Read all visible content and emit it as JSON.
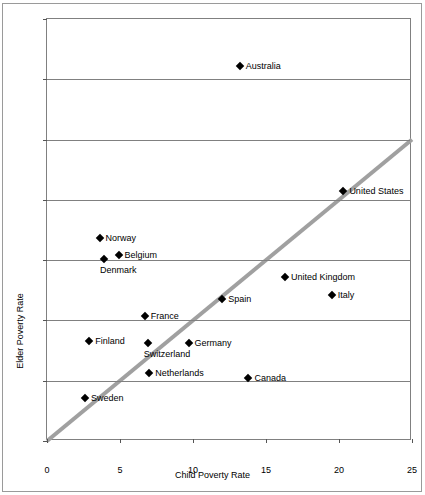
{
  "chart_data": {
    "type": "scatter",
    "title": "",
    "xlabel": "Child Poverty Rate",
    "ylabel": "Elder Poverty Rate",
    "xlim": [
      0,
      25
    ],
    "ylim": [
      0,
      35
    ],
    "xticks": [
      0,
      5,
      10,
      15,
      20,
      25
    ],
    "yticks": [
      0,
      5,
      10,
      15,
      20,
      25,
      30,
      35
    ],
    "grid": "horizontal",
    "legend": "none",
    "reference_line": {
      "name": "equality-line",
      "from": [
        0,
        0
      ],
      "to": [
        25,
        25
      ],
      "color": "#a0a0a0"
    },
    "marker_color": "#000000",
    "points": [
      {
        "label": "Australia",
        "x": 13.2,
        "y": 31.1,
        "label_pos": "right"
      },
      {
        "label": "United States",
        "x": 20.3,
        "y": 20.7,
        "label_pos": "right"
      },
      {
        "label": "Norway",
        "x": 3.6,
        "y": 16.8,
        "label_pos": "right"
      },
      {
        "label": "Belgium",
        "x": 4.9,
        "y": 15.4,
        "label_pos": "right"
      },
      {
        "label": "Denmark",
        "x": 3.9,
        "y": 15.1,
        "label_pos": "below"
      },
      {
        "label": "United Kingdom",
        "x": 16.3,
        "y": 13.6,
        "label_pos": "right"
      },
      {
        "label": "Italy",
        "x": 19.5,
        "y": 12.1,
        "label_pos": "right"
      },
      {
        "label": "Spain",
        "x": 12.0,
        "y": 11.8,
        "label_pos": "right"
      },
      {
        "label": "France",
        "x": 6.7,
        "y": 10.4,
        "label_pos": "right"
      },
      {
        "label": "Finland",
        "x": 2.9,
        "y": 8.3,
        "label_pos": "right"
      },
      {
        "label": "Germany",
        "x": 9.7,
        "y": 8.1,
        "label_pos": "right"
      },
      {
        "label": "Switzerland",
        "x": 6.9,
        "y": 8.1,
        "label_pos": "below"
      },
      {
        "label": "Netherlands",
        "x": 7.0,
        "y": 5.6,
        "label_pos": "right"
      },
      {
        "label": "Canada",
        "x": 13.8,
        "y": 5.2,
        "label_pos": "right"
      },
      {
        "label": "Sweden",
        "x": 2.6,
        "y": 3.6,
        "label_pos": "right"
      }
    ]
  }
}
